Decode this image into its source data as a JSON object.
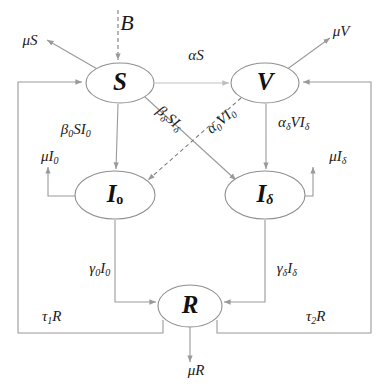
{
  "diagram": {
    "type": "compartmental-flow-diagram",
    "background_color": "#ffffff",
    "edge_color": "#9a9a9a",
    "node_fill": "#ffffff",
    "node_stroke": "#8f8f8f",
    "text_color": "#111111"
  },
  "nodes": [
    {
      "id": "S",
      "label": "S",
      "sub": "",
      "cx": 120,
      "cy": 83,
      "rx": 34,
      "ry": 20
    },
    {
      "id": "V",
      "label": "V",
      "sub": "",
      "cx": 265,
      "cy": 83,
      "rx": 34,
      "ry": 20
    },
    {
      "id": "I0",
      "label": "I",
      "sub": "o",
      "cx": 115,
      "cy": 195,
      "rx": 40,
      "ry": 24
    },
    {
      "id": "Id",
      "label": "I",
      "sub": "δ",
      "cx": 265,
      "cy": 195,
      "rx": 40,
      "ry": 24
    },
    {
      "id": "R",
      "label": "R",
      "sub": "",
      "cx": 190,
      "cy": 306,
      "rx": 32,
      "ry": 21
    }
  ],
  "flows": [
    {
      "id": "birth",
      "label": "B",
      "sub": "",
      "from": "external",
      "to": "S",
      "style": "dashed",
      "x": 127,
      "y": 25,
      "rotate": 0,
      "size": 22
    },
    {
      "id": "death-S",
      "label": "μS",
      "sub": "",
      "from": "S",
      "to": "external",
      "style": "solid",
      "x": 30,
      "y": 42,
      "rotate": 0,
      "size": 15
    },
    {
      "id": "death-V",
      "label": "μV",
      "sub": "",
      "from": "V",
      "to": "external",
      "style": "solid",
      "x": 341,
      "y": 33,
      "rotate": 0,
      "size": 15
    },
    {
      "id": "vaccination",
      "label": "αS",
      "sub": "",
      "from": "S",
      "to": "V",
      "style": "solid",
      "x": 196,
      "y": 57,
      "rotate": 0,
      "size": 15
    },
    {
      "id": "infection-S-I0",
      "label": "β",
      "sub": "0",
      "tail": "SI",
      "tailsub": "0",
      "from": "S",
      "to": "I0",
      "style": "solid",
      "x": 72,
      "y": 131,
      "rotate": 0,
      "size": 15
    },
    {
      "id": "infection-S-Id",
      "label": "β",
      "sub": "δ",
      "tail": "SI",
      "tailsub": "δ",
      "from": "S",
      "to": "Id",
      "style": "solid",
      "x": 166,
      "y": 117,
      "rotate": 40,
      "size": 15
    },
    {
      "id": "infection-V-I0",
      "label": "α",
      "sub": "0",
      "tail": "VI",
      "tailsub": "0",
      "from": "V",
      "to": "I0",
      "style": "dashed",
      "x": 219,
      "y": 124,
      "rotate": -40,
      "size": 15
    },
    {
      "id": "infection-V-Id",
      "label": "α",
      "sub": "δ",
      "tail": "VI",
      "tailsub": "δ",
      "from": "V",
      "to": "Id",
      "style": "solid",
      "x": 290,
      "y": 124,
      "rotate": 0,
      "size": 15
    },
    {
      "id": "death-I0",
      "label": "μI",
      "sub": "0",
      "from": "I0",
      "to": "external",
      "style": "solid",
      "x": 46,
      "y": 158,
      "rotate": 0,
      "size": 15
    },
    {
      "id": "death-Id",
      "label": "μI",
      "sub": "δ",
      "from": "Id",
      "to": "external",
      "style": "solid",
      "x": 334,
      "y": 158,
      "rotate": 0,
      "size": 15
    },
    {
      "id": "recovery-I0",
      "label": "γ",
      "sub": "0",
      "tail": "I",
      "tailsub": "0",
      "from": "I0",
      "to": "R",
      "style": "solid",
      "x": 96,
      "y": 270,
      "rotate": 0,
      "size": 15
    },
    {
      "id": "recovery-Id",
      "label": "γ",
      "sub": "δ",
      "tail": "I",
      "tailsub": "δ",
      "from": "Id",
      "to": "R",
      "style": "solid",
      "x": 283,
      "y": 270,
      "rotate": 0,
      "size": 15
    },
    {
      "id": "waning-to-S",
      "label": "τ",
      "sub": "1",
      "tail": "R",
      "tailsub": "",
      "from": "R",
      "to": "S",
      "style": "solid",
      "x": 48,
      "y": 318,
      "rotate": 0,
      "size": 15
    },
    {
      "id": "waning-to-V",
      "label": "τ",
      "sub": "2",
      "tail": "R",
      "tailsub": "",
      "from": "R",
      "to": "V",
      "style": "solid",
      "x": 312,
      "y": 318,
      "rotate": 0,
      "size": 15
    },
    {
      "id": "death-R",
      "label": "μR",
      "sub": "",
      "from": "R",
      "to": "external",
      "style": "solid",
      "x": 196,
      "y": 372,
      "rotate": 0,
      "size": 15
    }
  ]
}
